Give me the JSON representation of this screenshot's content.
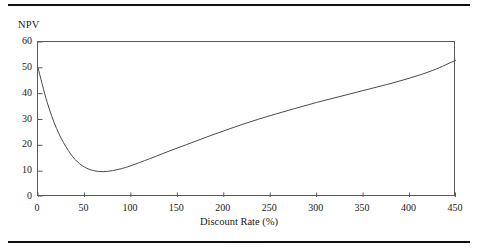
{
  "figure": {
    "title_fragment": "",
    "has_top_rule": true,
    "has_bottom_rule": true,
    "rule_color": "#111111"
  },
  "chart_data": {
    "type": "line",
    "title": "",
    "xlabel": "Discount Rate (%)",
    "ylabel": "NPV",
    "xlim": [
      0,
      450
    ],
    "ylim": [
      0,
      60
    ],
    "xticks": [
      0,
      50,
      100,
      150,
      200,
      250,
      300,
      350,
      400,
      450
    ],
    "xticklabels": [
      "0",
      "50",
      "100",
      "150",
      "200",
      "250",
      "300",
      "350",
      "400",
      "450"
    ],
    "yticks": [
      0,
      10,
      20,
      30,
      40,
      50,
      60
    ],
    "yticklabels": [
      "0",
      "10",
      "20",
      "30",
      "40",
      "50",
      "60"
    ],
    "grid": false,
    "legend": null,
    "line_color": "#4a4a4a",
    "line_width": 1,
    "series": [
      {
        "name": "NPV",
        "x": [
          0,
          10,
          20,
          30,
          40,
          50,
          60,
          70,
          80,
          90,
          100,
          120,
          140,
          160,
          180,
          200,
          225,
          250,
          275,
          300,
          325,
          350,
          375,
          400,
          425,
          450
        ],
        "y": [
          50.0,
          36.5,
          26.5,
          19.5,
          14.5,
          11.6,
          10.2,
          9.8,
          10.2,
          11.0,
          12.1,
          14.8,
          17.6,
          20.3,
          23.0,
          25.6,
          28.7,
          31.5,
          34.1,
          36.6,
          38.9,
          41.2,
          43.5,
          46.0,
          49.0,
          53.0
        ]
      }
    ],
    "annotations": [
      {
        "label": "minimum",
        "x": 70,
        "y": 9.8
      },
      {
        "label": "start",
        "x": 0,
        "y": 50.0
      },
      {
        "label": "end",
        "x": 450,
        "y": 53.0
      }
    ]
  }
}
